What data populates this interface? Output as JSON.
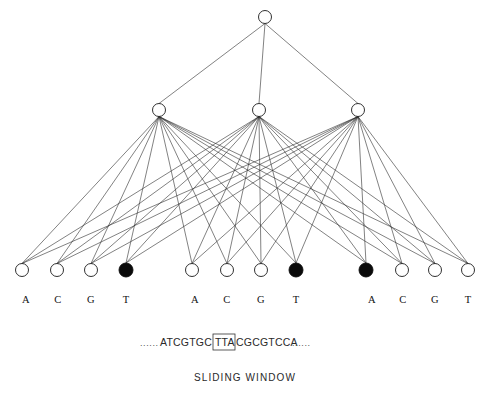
{
  "figure": {
    "background_color": "#ffffff",
    "edge_color": "#2e2e2e",
    "node_stroke_color": "#1a1a1a",
    "node_fill_open": "#ffffff",
    "node_fill_active": "#0a0a0a"
  },
  "network": {
    "output_layer": {
      "name": "output-layer",
      "nodes": [
        {
          "id": "out-1",
          "cx": 265,
          "cy": 17,
          "r": 6.5,
          "state": "open"
        }
      ]
    },
    "hidden_layer": {
      "name": "hidden-layer",
      "nodes": [
        {
          "id": "hid-1",
          "cx": 159,
          "cy": 110,
          "r": 6.5,
          "state": "open"
        },
        {
          "id": "hid-2",
          "cx": 259,
          "cy": 110,
          "r": 6.5,
          "state": "open"
        },
        {
          "id": "hid-3",
          "cx": 358,
          "cy": 110,
          "r": 6.5,
          "state": "open"
        }
      ]
    },
    "input_layer": {
      "name": "input-layer",
      "groups": [
        {
          "group_index": 1,
          "nodes": [
            {
              "id": "in-1-A",
              "base": "A",
              "cx": 22,
              "cy": 270,
              "r": 6.5,
              "state": "open"
            },
            {
              "id": "in-1-C",
              "base": "C",
              "cx": 57,
              "cy": 270,
              "r": 6.5,
              "state": "open"
            },
            {
              "id": "in-1-G",
              "base": "G",
              "cx": 91,
              "cy": 270,
              "r": 6.5,
              "state": "open"
            },
            {
              "id": "in-1-T",
              "base": "T",
              "cx": 126,
              "cy": 270,
              "r": 7.0,
              "state": "active"
            }
          ]
        },
        {
          "group_index": 2,
          "nodes": [
            {
              "id": "in-2-A",
              "base": "A",
              "cx": 192,
              "cy": 270,
              "r": 6.5,
              "state": "open"
            },
            {
              "id": "in-2-C",
              "base": "C",
              "cx": 227,
              "cy": 270,
              "r": 6.5,
              "state": "open"
            },
            {
              "id": "in-2-G",
              "base": "G",
              "cx": 261,
              "cy": 270,
              "r": 6.5,
              "state": "open"
            },
            {
              "id": "in-2-T",
              "base": "T",
              "cx": 296,
              "cy": 270,
              "r": 7.0,
              "state": "active"
            }
          ]
        },
        {
          "group_index": 3,
          "nodes": [
            {
              "id": "in-3-A",
              "base": "A",
              "cx": 366,
              "cy": 270,
              "r": 7.0,
              "state": "active"
            },
            {
              "id": "in-3-C",
              "base": "C",
              "cx": 402,
              "cy": 270,
              "r": 6.5,
              "state": "open"
            },
            {
              "id": "in-3-G",
              "base": "G",
              "cx": 435,
              "cy": 270,
              "r": 6.5,
              "state": "open"
            },
            {
              "id": "in-3-T",
              "base": "T",
              "cx": 468,
              "cy": 270,
              "r": 6.5,
              "state": "open"
            }
          ]
        }
      ],
      "base_labels": [
        {
          "text": "A",
          "x": 26,
          "y": 303
        },
        {
          "text": "C",
          "x": 58,
          "y": 303
        },
        {
          "text": "G",
          "x": 91,
          "y": 303
        },
        {
          "text": "T",
          "x": 126,
          "y": 303
        },
        {
          "text": "A",
          "x": 195,
          "y": 303
        },
        {
          "text": "C",
          "x": 227,
          "y": 303
        },
        {
          "text": "G",
          "x": 261,
          "y": 303
        },
        {
          "text": "T",
          "x": 296,
          "y": 303
        },
        {
          "text": "A",
          "x": 372,
          "y": 303
        },
        {
          "text": "C",
          "x": 403,
          "y": 303
        },
        {
          "text": "G",
          "x": 435,
          "y": 303
        },
        {
          "text": "T",
          "x": 468,
          "y": 303
        }
      ]
    }
  },
  "sequence": {
    "name": "dna-sequence",
    "left_ellipsis": "......",
    "prefix": "ATCGTGC",
    "window": "TTA",
    "suffix": "CGCGTCCA",
    "right_ellipsis": "......",
    "full_text": "......ATCGTGCTTACGCGTCCA......",
    "window_box": {
      "x": 213,
      "y": 334,
      "width": 22,
      "height": 16
    }
  },
  "caption": {
    "name": "sliding-window-caption",
    "text": "SLIDING  WINDOW"
  }
}
